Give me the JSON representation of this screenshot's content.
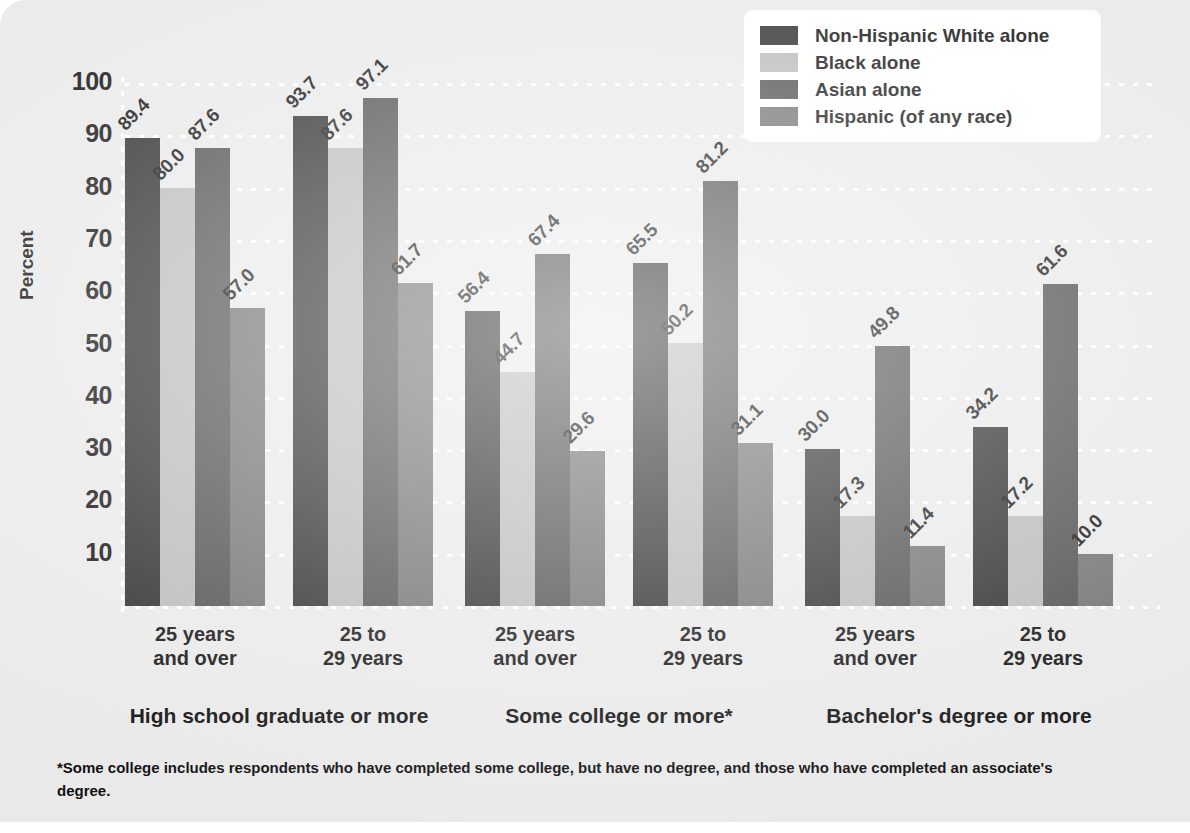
{
  "chart_data": {
    "type": "bar",
    "title": "",
    "xlabel": "",
    "ylabel": "Percent",
    "ylim": [
      0,
      100
    ],
    "yticks": [
      100,
      90,
      80,
      70,
      60,
      50,
      40,
      30,
      20,
      10
    ],
    "grid": true,
    "legend_position": "top-right",
    "categories": [
      "25 years\nand over",
      "25 to\n29 years",
      "25 years\nand over",
      "25 to\n29 years",
      "25 years\nand over",
      "25 to\n29 years"
    ],
    "supergroups": [
      "High school graduate or more",
      "Some college or more*",
      "Bachelor's degree or more"
    ],
    "series": [
      {
        "name": "Non-Hispanic White alone",
        "color": "#2b2b2b",
        "values": [
          89.4,
          93.7,
          56.4,
          65.5,
          30.0,
          34.2
        ]
      },
      {
        "name": "Black alone",
        "color": "#b9b9b9",
        "values": [
          80.0,
          87.6,
          44.7,
          50.2,
          17.3,
          17.2
        ]
      },
      {
        "name": "Asian alone",
        "color": "#4d4d4d",
        "values": [
          87.6,
          97.1,
          67.4,
          81.2,
          49.8,
          61.6
        ]
      },
      {
        "name": "Hispanic (of any race)",
        "color": "#6f6f6f",
        "values": [
          57.0,
          61.7,
          29.6,
          31.1,
          11.4,
          10.0
        ]
      }
    ],
    "annotations": [
      "*Some college includes respondents who have completed some college, but have no degree, and those who have completed an associate's degree."
    ]
  },
  "axis": {
    "ylabel": "Percent",
    "ticks": [
      "100",
      "90",
      "80",
      "70",
      "60",
      "50",
      "40",
      "30",
      "20",
      "10"
    ]
  },
  "legend": {
    "items": [
      {
        "label": "Non-Hispanic White alone",
        "color": "#2b2b2b"
      },
      {
        "label": "Black alone",
        "color": "#b9b9b9"
      },
      {
        "label": "Asian alone",
        "color": "#4d4d4d"
      },
      {
        "label": "Hispanic (of any race)",
        "color": "#6f6f6f"
      }
    ]
  },
  "xaxis": {
    "age_labels": [
      {
        "line1": "25 years",
        "line2": "and over"
      },
      {
        "line1": "25 to",
        "line2": "29 years"
      },
      {
        "line1": "25 years",
        "line2": "and over"
      },
      {
        "line1": "25 to",
        "line2": "29 years"
      },
      {
        "line1": "25 years",
        "line2": "and over"
      },
      {
        "line1": "25 to",
        "line2": "29 years"
      }
    ],
    "group_labels": [
      "High school graduate or more",
      "Some college or more*",
      "Bachelor's degree or more"
    ]
  },
  "footnote": {
    "text": "*Some college includes respondents who have completed some college, but have no degree, and those who have completed an associate's degree."
  }
}
